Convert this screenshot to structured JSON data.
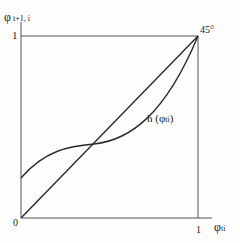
{
  "figure": {
    "y_axis_label": {
      "symbol": "φ",
      "subscript": "t+1, i"
    },
    "x_axis_label": {
      "symbol": "φ",
      "subscript": "ti"
    },
    "origin_label": "0",
    "y_tick_one": "1",
    "x_tick_one": "1",
    "diagonal_annotation": "45°",
    "curve_label": {
      "prefix": "h (",
      "symbol": "φ",
      "subscript": "ti",
      "suffix": ")"
    }
  },
  "colors": {
    "line": "#2a2a2a",
    "axis": "#555555",
    "background": "#fdfdfb"
  }
}
